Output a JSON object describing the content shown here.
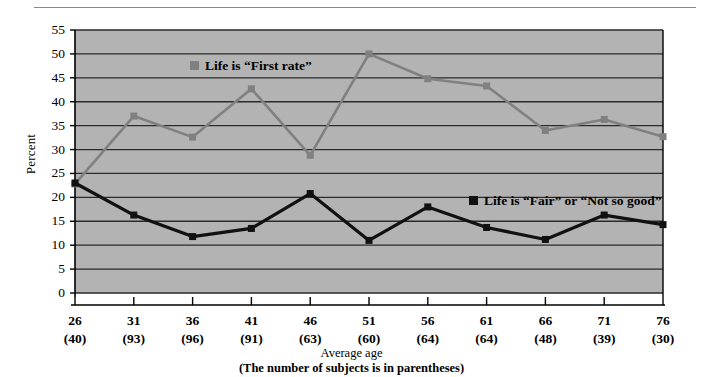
{
  "chart_data": {
    "type": "line",
    "title": "",
    "xlabel": "Average age",
    "xlabel_note": "(The number of subjects is in parentheses)",
    "ylabel": "Percent",
    "ylim": [
      0,
      55
    ],
    "ytick_step": 5,
    "yticks": [
      "55",
      "50",
      "45",
      "40",
      "35",
      "30",
      "25",
      "20",
      "15",
      "10",
      "5",
      "0"
    ],
    "grid": true,
    "legend_position": "inside-plot",
    "categories": [
      "26",
      "31",
      "36",
      "41",
      "46",
      "51",
      "56",
      "61",
      "66",
      "71",
      "76"
    ],
    "subject_counts": [
      "(40)",
      "(93)",
      "(96)",
      "(91)",
      "(63)",
      "(60)",
      "(64)",
      "(64)",
      "(48)",
      "(39)",
      "(30)"
    ],
    "series": [
      {
        "name": "Life is “First rate”",
        "color": "#808080",
        "marker": "square",
        "values": [
          22.8,
          37.0,
          32.6,
          42.7,
          28.8,
          50.0,
          44.8,
          43.3,
          34.0,
          36.3,
          32.7
        ]
      },
      {
        "name": "Life is “Fair” or “Not so good”",
        "color": "#111111",
        "marker": "square",
        "values": [
          23.0,
          16.3,
          11.8,
          13.5,
          20.8,
          11.0,
          18.0,
          13.7,
          11.2,
          16.3,
          14.3
        ]
      }
    ]
  },
  "axes": {
    "y_title": "Percent"
  },
  "legend": {
    "first_rate": "Life is “First rate”",
    "fair": "Life is “Fair” or “Not so good”"
  },
  "caption": {
    "line1": "Average age",
    "line2": "(The number of subjects is in parentheses)"
  },
  "colors": {
    "plot_background": "#b3b3b3",
    "gridline": "#2b2b2b",
    "series_first_rate": "#808080",
    "series_fair": "#111111",
    "axis": "#000000",
    "top_rule": "#8a8a8a"
  }
}
